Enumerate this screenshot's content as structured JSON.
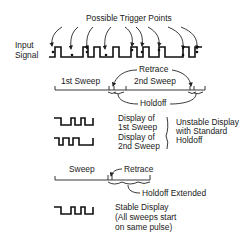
{
  "title": "Possible Trigger Points",
  "input_signal": {
    "label_line1": "Input",
    "label_line2": "Signal"
  },
  "standard_holdoff": {
    "first_sweep": "1st Sweep",
    "second_sweep": "2nd Sweep",
    "retrace": "Retrace",
    "holdoff": "Holdoff"
  },
  "displays_unstable": {
    "first": {
      "line1": "Display of",
      "line2": "1st Sweep"
    },
    "second": {
      "line1": "Display of",
      "line2": "2nd Sweep"
    },
    "note": {
      "line1": "Unstable Display",
      "line2": "with Standard",
      "line3": "Holdoff"
    }
  },
  "extended_holdoff": {
    "sweep": "Sweep",
    "retrace": "Retrace",
    "holdoff": "Holdoff Extended"
  },
  "display_stable": {
    "line1": "Stable Display",
    "line2": "(All sweeps start",
    "line3": "on same pulse)"
  },
  "colors": {
    "ink": "#111111",
    "background": "#ffffff"
  }
}
